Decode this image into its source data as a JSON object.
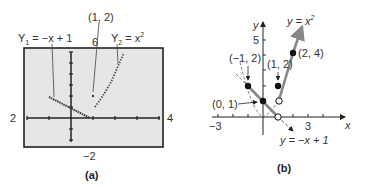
{
  "panel_a": {
    "caption": "(a)",
    "window": {
      "xmin": "2",
      "xmax": "4",
      "ymin": "−2",
      "ymax": "6"
    },
    "label_y1": "Y",
    "label_y1_sub": "1",
    "label_y1_rhs": " = −x + 1",
    "label_y2": "Y",
    "label_y2_sub": "2",
    "label_y2_rhs": " = x",
    "label_y2_exp": "2",
    "label_point": "(1, 2)",
    "screen_color": "#e6e6e6"
  },
  "panel_b": {
    "caption": "(b)",
    "axis_x": "x",
    "axis_y": "y",
    "tick_x_neg": "−3",
    "tick_x_pos": "3",
    "tick_y": "5",
    "label_parabola": "y = x",
    "label_parabola_exp": "2",
    "label_line": "y = −x + 1",
    "points": [
      {
        "label": "(−1, 2)",
        "x": -1,
        "y": 2,
        "filled": true
      },
      {
        "label": "(1, 2)",
        "x": 1,
        "y": 2,
        "filled": true
      },
      {
        "label": "(2, 4)",
        "x": 2,
        "y": 4,
        "filled": true
      },
      {
        "label": "(0, 1)",
        "x": 0,
        "y": 1,
        "filled": true
      }
    ],
    "curve_color": "#888888"
  }
}
